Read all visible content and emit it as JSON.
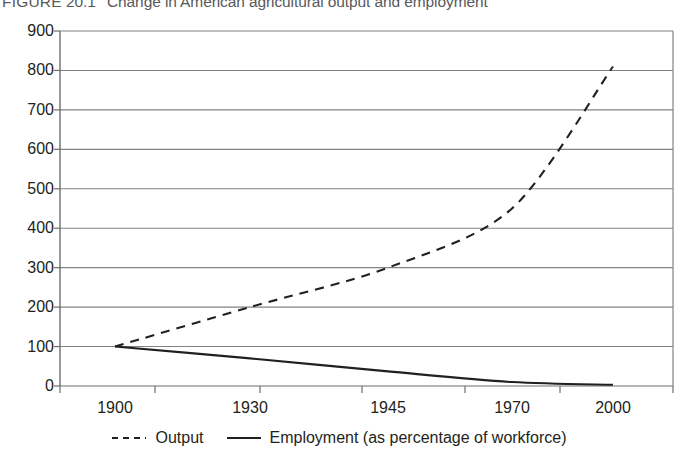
{
  "figure": {
    "label": "FIGURE",
    "number": "20.1",
    "caption": "Change in American agricultural output and employment"
  },
  "colors": {
    "axis": "#6d6e71",
    "grid": "#808285",
    "series": "#231f20",
    "text": "#231f20",
    "title": "#58595b"
  },
  "chart_data": {
    "type": "line",
    "title": "Change in American agricultural output and employment",
    "xlabel": "",
    "ylabel": "",
    "categories": [
      "1900",
      "1930",
      "1945",
      "1970",
      "2000"
    ],
    "ylim": [
      0,
      900
    ],
    "yticks": [
      0,
      100,
      200,
      300,
      400,
      500,
      600,
      700,
      800,
      900
    ],
    "ytick_labels": [
      "0",
      "100",
      "200",
      "300",
      "400",
      "500",
      "600",
      "700",
      "800",
      "900"
    ],
    "grid": "horizontal",
    "legend_position": "bottom",
    "series": [
      {
        "name": "Output",
        "style": "dashed",
        "color": "#231f20",
        "values": [
          100,
          200,
          300,
          450,
          810
        ]
      },
      {
        "name": "Employment (as percentage of workforce)",
        "style": "solid",
        "color": "#231f20",
        "values": [
          100,
          70,
          37,
          10,
          3
        ]
      }
    ]
  },
  "legend": {
    "items": [
      {
        "label": "Output",
        "style": "dashed"
      },
      {
        "label": "Employment (as percentage of workforce)",
        "style": "solid"
      }
    ]
  }
}
